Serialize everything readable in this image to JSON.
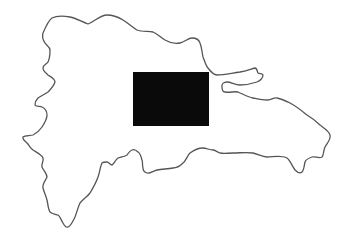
{
  "map": {
    "subject": "Dominican Republic outline",
    "background_color": "#ffffff",
    "outline_color": "#555555",
    "highlight": {
      "shape": "rectangle",
      "color": "#0a0a0a",
      "x": 133,
      "y": 72,
      "width": 76,
      "height": 54
    }
  }
}
